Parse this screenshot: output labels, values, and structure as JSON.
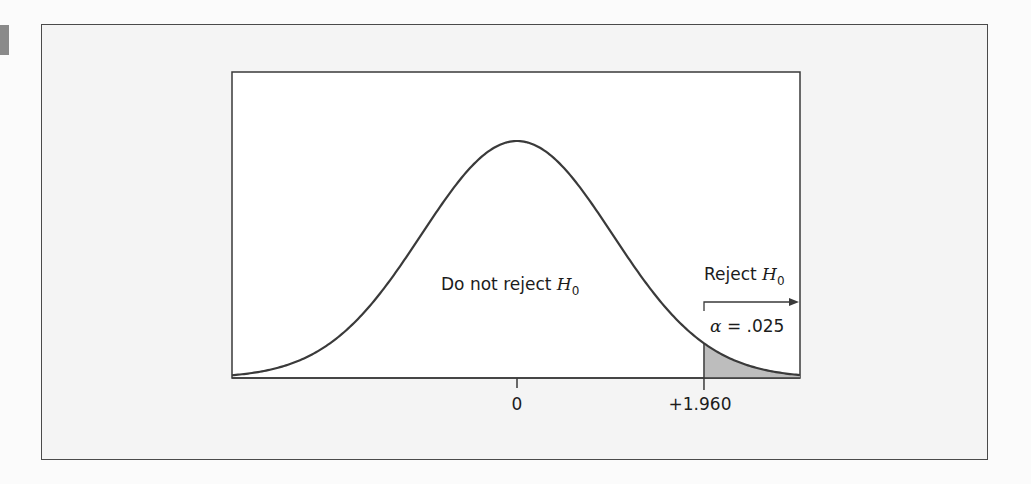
{
  "chart_data": {
    "type": "area",
    "title": "",
    "subtitle": "",
    "xlabel": "",
    "ylabel": "",
    "distribution": "standard normal",
    "x_range": [
      -3.0,
      3.0
    ],
    "peak": {
      "x": 0,
      "label": "0"
    },
    "critical_value": {
      "x": 1.96,
      "label": "+1.960"
    },
    "x_ticks": [
      {
        "value": 0,
        "label": "0"
      },
      {
        "value": 1.96,
        "label": "+1.960"
      }
    ],
    "regions": [
      {
        "name": "non-rejection",
        "from": -3.0,
        "to": 1.96,
        "label": "Do not reject H0",
        "shaded": false
      },
      {
        "name": "rejection",
        "from": 1.96,
        "to": 3.0,
        "label": "Reject H0",
        "shaded": true,
        "alpha": 0.025,
        "alpha_label": "α = .025"
      }
    ],
    "grid": false,
    "legend": null
  },
  "labels": {
    "do_not_reject": "Do not reject ",
    "reject": "Reject ",
    "hypothesis_symbol": "H",
    "hypothesis_subscript": "0",
    "alpha_symbol": "α",
    "alpha_value": " = .025",
    "tick_zero": "0",
    "tick_critical": "+1.960"
  },
  "colors": {
    "frame_bg": "#f4f4f4",
    "plot_bg": "#ffffff",
    "curve": "#3a3a3a",
    "shade": "#bdbdbd",
    "tab_marker": "#8a8a8a"
  }
}
